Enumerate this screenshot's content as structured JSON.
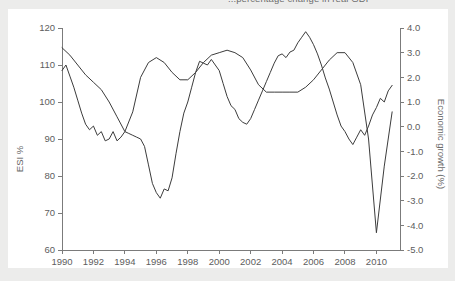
{
  "page": {
    "background_color": "#ececeb",
    "panel_color": "#ffffff"
  },
  "title": {
    "text": "...percentage change in real GDP",
    "note": "clipped at top edge of screenshot",
    "color": "#6e6e6e"
  },
  "chart_data": {
    "type": "line",
    "title": "...percentage change in real GDP",
    "subtitle": "",
    "xlabel": "",
    "ylabel": "ESI  %",
    "y2label": "Economic growth (%)",
    "xlim": [
      1990,
      2011.5
    ],
    "ylim": [
      60,
      120
    ],
    "y2lim": [
      -5.0,
      4.0
    ],
    "grid": false,
    "legend_position": "none",
    "xticks": [
      1990,
      1992,
      1994,
      1996,
      1998,
      2000,
      2002,
      2004,
      2006,
      2008,
      2010
    ],
    "xticklabels": [
      "1990",
      "1992",
      "1994",
      "1996",
      "1998",
      "2000",
      "2002",
      "2004",
      "2006",
      "2008",
      "2010"
    ],
    "yticks": [
      60,
      70,
      80,
      90,
      100,
      110,
      120
    ],
    "yticklabels": [
      "60",
      "70",
      "80",
      "90",
      "100",
      "110",
      "120"
    ],
    "y2ticks": [
      -5.0,
      -4.0,
      -3.0,
      -2.0,
      -1.0,
      0.0,
      1.0,
      2.0,
      3.0,
      4.0
    ],
    "y2ticklabels": [
      "-5.0",
      "-4.0",
      "-3.0",
      "-2.0",
      "-1.0",
      "0.0",
      "1.0",
      "2.0",
      "3.0",
      "4.0"
    ],
    "line_color": "#3c3c3c",
    "axis_color": "#7b7b7b",
    "series": [
      {
        "name": "ESI",
        "axis": "left",
        "units": "index",
        "x": [
          1990.0,
          1990.25,
          1990.5,
          1990.75,
          1991.0,
          1991.25,
          1991.5,
          1991.75,
          1992.0,
          1992.25,
          1992.5,
          1992.75,
          1993.0,
          1993.25,
          1993.5,
          1993.75,
          1994.0,
          1994.25,
          1994.5,
          1994.75,
          1995.0,
          1995.25,
          1995.5,
          1995.75,
          1996.0,
          1996.25,
          1996.5,
          1996.75,
          1997.0,
          1997.25,
          1997.5,
          1997.75,
          1998.0,
          1998.25,
          1998.5,
          1998.75,
          1999.0,
          1999.25,
          1999.5,
          1999.75,
          2000.0,
          2000.25,
          2000.5,
          2000.75,
          2001.0,
          2001.25,
          2001.5,
          2001.75,
          2002.0,
          2002.25,
          2002.5,
          2002.75,
          2003.0,
          2003.25,
          2003.5,
          2003.75,
          2004.0,
          2004.25,
          2004.5,
          2004.75,
          2005.0,
          2005.25,
          2005.5,
          2005.75,
          2006.0,
          2006.25,
          2006.5,
          2006.75,
          2007.0,
          2007.25,
          2007.5,
          2007.75,
          2008.0,
          2008.25,
          2008.5,
          2008.75,
          2009.0,
          2009.25,
          2009.5,
          2009.75,
          2010.0,
          2010.25,
          2010.5,
          2010.75,
          2011.0
        ],
        "values": [
          108.5,
          110.0,
          107.0,
          104.0,
          100.5,
          97.0,
          94.0,
          92.5,
          93.5,
          91.0,
          92.0,
          89.5,
          90.0,
          92.0,
          89.5,
          90.5,
          92.0,
          91.5,
          91.0,
          90.5,
          90.0,
          88.0,
          83.0,
          78.0,
          75.5,
          74.0,
          76.5,
          76.0,
          79.5,
          86.0,
          92.0,
          97.0,
          100.0,
          104.0,
          108.0,
          111.0,
          110.5,
          110.0,
          111.5,
          110.0,
          108.5,
          105.0,
          101.5,
          99.0,
          98.0,
          95.5,
          94.5,
          94.0,
          95.5,
          98.0,
          100.5,
          103.0,
          105.5,
          108.0,
          110.5,
          112.5,
          113.0,
          112.0,
          113.5,
          114.0,
          116.0,
          117.5,
          119.0,
          117.5,
          115.5,
          113.0,
          110.0,
          106.5,
          103.5,
          100.0,
          96.5,
          93.5,
          92.0,
          90.0,
          88.5,
          90.5,
          92.5,
          91.0,
          93.5,
          96.5,
          98.5,
          101.0,
          100.0,
          103.0,
          104.5
        ]
      },
      {
        "name": "Economic growth",
        "axis": "right",
        "units": "percent",
        "x": [
          1990.0,
          1990.5,
          1991.0,
          1991.5,
          1992.0,
          1992.5,
          1993.0,
          1993.5,
          1994.0,
          1994.5,
          1995.0,
          1995.5,
          1996.0,
          1996.5,
          1997.0,
          1997.5,
          1998.0,
          1998.5,
          1999.0,
          1999.5,
          2000.0,
          2000.5,
          2001.0,
          2001.5,
          2002.0,
          2002.5,
          2003.0,
          2003.5,
          2004.0,
          2004.5,
          2005.0,
          2005.5,
          2006.0,
          2006.5,
          2007.0,
          2007.5,
          2008.0,
          2008.5,
          2009.0,
          2009.5,
          2010.0,
          2010.5,
          2011.0
        ],
        "values": [
          3.2,
          2.9,
          2.5,
          2.1,
          1.8,
          1.5,
          1.0,
          0.4,
          -0.2,
          0.6,
          2.0,
          2.6,
          2.8,
          2.6,
          2.2,
          1.9,
          1.9,
          2.2,
          2.6,
          2.9,
          3.0,
          3.1,
          3.0,
          2.8,
          2.3,
          1.7,
          1.4,
          1.4,
          1.4,
          1.4,
          1.4,
          1.6,
          1.9,
          2.3,
          2.7,
          3.0,
          3.0,
          2.6,
          1.7,
          -0.5,
          -4.3,
          -1.6,
          0.6
        ]
      }
    ]
  },
  "axes": {
    "left": {
      "label": "ESI  %"
    },
    "right": {
      "label": "Economic growth (%)"
    }
  }
}
